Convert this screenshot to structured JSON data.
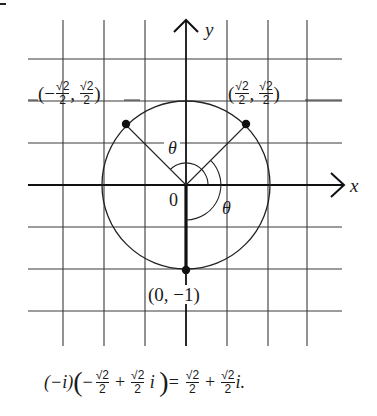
{
  "figure": {
    "axes": {
      "x_label": "x",
      "y_label": "y",
      "origin_label": "0"
    },
    "grid": {
      "vertical_lines_x": [
        63,
        104,
        145,
        227,
        268,
        307
      ],
      "horizontal_lines_y": [
        59,
        101,
        143,
        227,
        269,
        311
      ],
      "origin": [
        186,
        185
      ],
      "unit_px": 42
    },
    "circle": {
      "center": [
        186,
        185
      ],
      "radius_px": 84
    },
    "points": [
      {
        "name": "upper-left",
        "label_prefix": "(−",
        "num": "√2",
        "den": "2",
        "sep": ",",
        "label_suffix": ")",
        "x": 126,
        "y": 125
      },
      {
        "name": "upper-right",
        "label_prefix": "(",
        "num": "√2",
        "den": "2",
        "sep": ",",
        "label_suffix": ")",
        "x": 246,
        "y": 125
      },
      {
        "name": "bottom",
        "label": "(0, −1)",
        "x": 186,
        "y": 270
      }
    ],
    "angle_labels": [
      "θ",
      "θ"
    ],
    "point_labels": {
      "upper_left": {
        "open": "(−",
        "frac1_num": "√2",
        "frac1_den": "2",
        "comma": ",",
        "frac2_num": "√2",
        "frac2_den": "2",
        "close": ")"
      },
      "upper_right": {
        "open": "(",
        "frac1_num": "√2",
        "frac1_den": "2",
        "comma": ",",
        "frac2_num": "√2",
        "frac2_den": "2",
        "close": ")"
      },
      "bottom": "(0, −1)"
    }
  },
  "equation": {
    "factor": "(−i)",
    "open_paren": "(",
    "minus": "−",
    "f1_num": "√2",
    "f1_den": "2",
    "plus1": "+",
    "f2_num": "√2",
    "f2_den": "2",
    "i1": "i",
    "close_paren": ")",
    "equals": "=",
    "f3_num": "√2",
    "f3_den": "2",
    "plus2": "+",
    "f4_num": "√2",
    "f4_den": "2",
    "i2": "i."
  },
  "colors": {
    "ink": "#1a1a1a",
    "grid": "#3a3a3a",
    "background": "#ffffff"
  }
}
